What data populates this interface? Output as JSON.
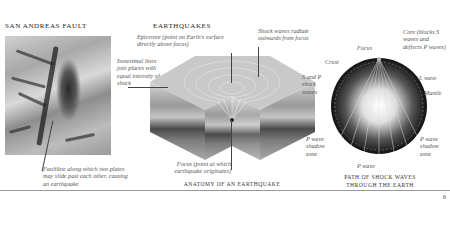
{
  "page": {
    "page_number": "6"
  },
  "san_andreas": {
    "title": "SAN ANDREAS FAULT",
    "faultline_label": "Faultline along which two plates may slide past each other, causing an earthquake"
  },
  "earthquakes": {
    "title": "EARTHQUAKES",
    "epicentre_label": "Epicentre (point on Earth's surface directly above focus)",
    "isoseismal_label": "Isoseismal lines join places with equal intensity of shock",
    "shock_waves_label": "Shock waves radiate outwards from focus",
    "focus_label": "Focus (point at which earthquake originates)",
    "caption": "ANATOMY OF AN EARTHQUAKE"
  },
  "earth_path": {
    "focus_label": "Focus",
    "crust_label": "Crust",
    "core_label": "Core (blocks S waves and deflects P waves)",
    "l_wave_label": "L wave",
    "mantle_label": "Mantle",
    "s_and_p_label": "S and P shock waves",
    "p_shadow_left_label": "P wave shadow zone",
    "p_shadow_right_label": "P wave shadow zone",
    "p_wave_label": "P wave",
    "caption_line1": "PATH OF SHOCK WAVES",
    "caption_line2": "THROUGH THE EARTH"
  }
}
